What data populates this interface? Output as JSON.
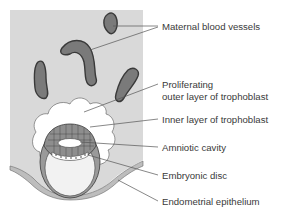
{
  "figure": {
    "type": "anatomical-diagram",
    "colors": {
      "background": "#ffffff",
      "endometrium": "#d9d9d9",
      "vessel_fill": "#7a7a7a",
      "vessel_outline": "#3a3a3a",
      "trophoblast_outer": "#ececec",
      "cell_layer": "#9a9a9a",
      "cavity": "#f2f2f2",
      "text": "#3a3a3a"
    }
  },
  "labels": [
    {
      "id": "maternal-blood-vessels",
      "text": "Maternal blood vessels"
    },
    {
      "id": "proliferating-outer-layer-line1",
      "text": "Proliferating"
    },
    {
      "id": "proliferating-outer-layer-line2",
      "text": "outer layer of trophoblast"
    },
    {
      "id": "inner-layer-trophoblast",
      "text": "Inner layer of trophoblast"
    },
    {
      "id": "amniotic-cavity",
      "text": "Amniotic cavity"
    },
    {
      "id": "embryonic-disc",
      "text": "Embryonic disc"
    },
    {
      "id": "endometrial-epithelium",
      "text": "Endometrial epithelium"
    }
  ]
}
